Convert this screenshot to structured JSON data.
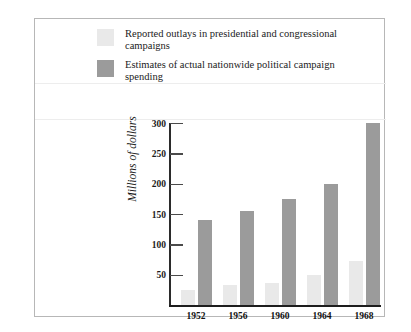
{
  "chart_data": {
    "type": "bar",
    "title": "",
    "xlabel": "",
    "ylabel": "Millions of dollars",
    "categories": [
      "1952",
      "1956",
      "1960",
      "1964",
      "1968"
    ],
    "ylim": [
      0,
      300
    ],
    "yticks": [
      50,
      100,
      150,
      200,
      250,
      300
    ],
    "ytick_labels": [
      "50",
      "100",
      "150",
      "200",
      "250",
      "300"
    ],
    "grid": false,
    "legend_position": "top-left",
    "series": [
      {
        "name": "Reported outlays in presidential and congressional campaigns",
        "color": "#e9e9e9",
        "values": [
          25,
          33,
          37,
          50,
          72
        ]
      },
      {
        "name": "Estimates of actual nationwide political campaign spending",
        "color": "#9b9b9b",
        "values": [
          140,
          155,
          175,
          200,
          300
        ]
      }
    ]
  },
  "legend": {
    "items": [
      {
        "label": "Reported outlays in presidential and congressional campaigns",
        "swatch": "light"
      },
      {
        "label": "Estimates of actual nationwide political campaign spending",
        "swatch": "dark"
      }
    ]
  },
  "colors": {
    "light_bar": "#e9e9e9",
    "dark_bar": "#9b9b9b",
    "axis": "#1d1d1d",
    "frame": "#b7b7b7"
  }
}
